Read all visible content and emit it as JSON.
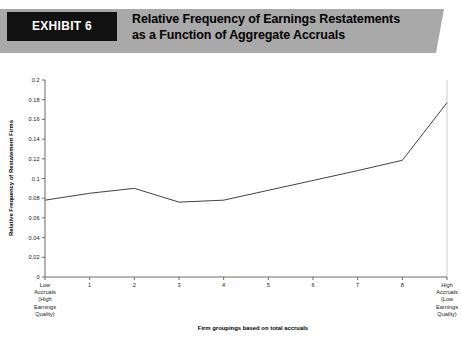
{
  "header": {
    "exhibit_tab_label": "EXHIBIT 6",
    "title_line1": "Relative Frequency of Earnings Restatements",
    "title_line2": "as a Function of Aggregate Accruals",
    "tab_bg_color": "#111111",
    "banner_bg_color": "#a9a9a9",
    "tab_text_color": "#ffffff"
  },
  "chart_data": {
    "type": "line",
    "title": "Relative Frequency of Earnings Restatements as a Function of Aggregate Accruals",
    "xlabel": "Firm groupings based on total accruals",
    "ylabel": "Relative Frequency of Restatement Firms",
    "categories": [
      "Low Accruals (High Earnings Quality)",
      "1",
      "2",
      "3",
      "4",
      "5",
      "6",
      "7",
      "8",
      "High Accruals (Low Earnings Quality)"
    ],
    "category_lines": [
      [
        "Low",
        "Accruals",
        "(High",
        "Earnings",
        "Quality)"
      ],
      [
        "1"
      ],
      [
        "2"
      ],
      [
        "3"
      ],
      [
        "4"
      ],
      [
        "5"
      ],
      [
        "6"
      ],
      [
        "7"
      ],
      [
        "8"
      ],
      [
        "High",
        "Accruals",
        "(Low",
        "Earnings",
        "Quality)"
      ]
    ],
    "values": [
      0.078,
      0.085,
      0.09,
      0.076,
      0.078,
      0.088,
      0.098,
      0.108,
      0.1185,
      0.177
    ],
    "ylim": [
      0,
      0.2
    ],
    "ytick_values": [
      0,
      0.02,
      0.04,
      0.06,
      0.08,
      0.1,
      0.12,
      0.14,
      0.16,
      0.18,
      0.2
    ],
    "ytick_labels": [
      "0",
      "0.02",
      "0.04",
      "0.06",
      "0.08",
      "0.1",
      "0.12",
      "0.14",
      "0.16",
      "0.18",
      "0.2"
    ],
    "grid": false,
    "legend": false,
    "legend_position": "none",
    "line_color": "#2b2b2b",
    "axis_color": "#6b6b6b",
    "background_color": "#ffffff"
  }
}
